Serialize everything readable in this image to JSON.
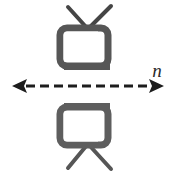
{
  "figure": {
    "type": "mirror-symmetry-diagram",
    "background_color": "#ffffff",
    "axis": {
      "label": "n",
      "label_style": "italic",
      "orientation": "horizontal",
      "arrowheads": "both",
      "line_style": "dashed",
      "color": "#1d1d1d",
      "x_start": 12,
      "x_end": 163,
      "y": 86,
      "dash_length": 9,
      "dash_gap": 5,
      "line_width": 3,
      "arrowhead_width": 14,
      "arrowhead_height": 15
    },
    "objects": [
      {
        "name": "television-top",
        "position": "above-axis",
        "orientation": "upright",
        "antenna_direction": "up",
        "body_color": "#5a5a5a",
        "outline_color": "#4a4a4a",
        "screen_color": "#ffffff",
        "side_panel_color": "#4e4e4e"
      },
      {
        "name": "television-bottom",
        "position": "below-axis",
        "orientation": "mirrored-vertically",
        "antenna_direction": "down",
        "body_color": "#5a5a5a",
        "outline_color": "#4a4a4a",
        "screen_color": "#ffffff",
        "side_panel_color": "#4e4e4e"
      }
    ],
    "colors": {
      "stroke_dark": "#3a3a3a",
      "tv_gray": "#5a5a5a",
      "tv_gray_dark": "#4b4b4b",
      "screen_white": "#ffffff",
      "background": "#ffffff"
    }
  }
}
